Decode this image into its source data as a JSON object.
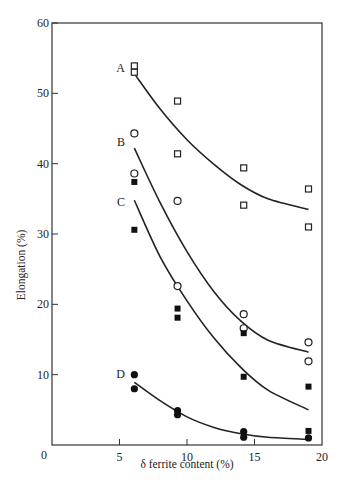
{
  "chart_data": {
    "type": "scatter",
    "title": "",
    "xlabel": "δ ferrite content (%)",
    "ylabel": "Elongation (%)",
    "xlim": [
      0,
      20
    ],
    "ylim": [
      0,
      60
    ],
    "xticks": [
      0,
      5,
      10,
      15,
      20
    ],
    "yticks": [
      0,
      10,
      20,
      30,
      40,
      50,
      60
    ],
    "grid": false,
    "legend": "none (curves labelled A, B, C, D inline)",
    "series": [
      {
        "name": "A",
        "marker": "open-square",
        "points": [
          [
            6.1,
            53.9
          ],
          [
            6.1,
            53.0
          ],
          [
            9.3,
            48.9
          ],
          [
            9.3,
            41.4
          ],
          [
            14.2,
            39.4
          ],
          [
            14.2,
            34.1
          ],
          [
            19.0,
            36.4
          ],
          [
            19.0,
            31.0
          ]
        ],
        "fit_curve": [
          [
            6.1,
            52.8
          ],
          [
            8,
            47.8
          ],
          [
            10,
            43.4
          ],
          [
            12,
            39.9
          ],
          [
            14,
            37.0
          ],
          [
            16,
            35.0
          ],
          [
            19,
            33.5
          ]
        ]
      },
      {
        "name": "B",
        "marker": "open-circle",
        "points": [
          [
            6.1,
            44.3
          ],
          [
            6.1,
            38.6
          ],
          [
            9.3,
            34.7
          ],
          [
            9.3,
            22.6
          ],
          [
            14.2,
            18.6
          ],
          [
            14.2,
            16.6
          ],
          [
            19.0,
            14.6
          ],
          [
            19.0,
            11.9
          ]
        ],
        "fit_curve": [
          [
            6.1,
            42.2
          ],
          [
            8,
            34.5
          ],
          [
            10,
            27.5
          ],
          [
            12,
            21.8
          ],
          [
            14,
            17.6
          ],
          [
            16,
            14.9
          ],
          [
            19,
            13.2
          ]
        ]
      },
      {
        "name": "C",
        "marker": "filled-square",
        "points": [
          [
            6.1,
            37.4
          ],
          [
            6.1,
            30.6
          ],
          [
            9.3,
            19.4
          ],
          [
            9.3,
            18.1
          ],
          [
            14.2,
            15.9
          ],
          [
            14.2,
            9.7
          ],
          [
            19.0,
            8.3
          ],
          [
            19.0,
            2.0
          ]
        ],
        "fit_curve": [
          [
            6.1,
            34.8
          ],
          [
            8,
            26.8
          ],
          [
            10,
            20.5
          ],
          [
            12,
            15.2
          ],
          [
            14,
            11.0
          ],
          [
            16,
            7.8
          ],
          [
            19,
            5.0
          ]
        ]
      },
      {
        "name": "D",
        "marker": "filled-circle",
        "points": [
          [
            6.1,
            10.0
          ],
          [
            6.1,
            8.0
          ],
          [
            9.3,
            4.9
          ],
          [
            9.3,
            4.3
          ],
          [
            14.2,
            1.9
          ],
          [
            14.2,
            1.1
          ],
          [
            19.0,
            1.0
          ]
        ],
        "fit_curve": [
          [
            6.1,
            8.9
          ],
          [
            8,
            6.3
          ],
          [
            10,
            4.0
          ],
          [
            12,
            2.5
          ],
          [
            14,
            1.6
          ],
          [
            16,
            1.1
          ],
          [
            19,
            0.8
          ]
        ]
      }
    ]
  },
  "axes": {
    "x_label": "δ ferrite content (%)",
    "y_label": "Elongation (%)",
    "x_tick_labels": [
      "0",
      "5",
      "10",
      "15",
      "20"
    ],
    "y_tick_labels": [
      "0",
      "10",
      "20",
      "30",
      "40",
      "50",
      "60"
    ]
  },
  "curve_labels": [
    "A",
    "B",
    "C",
    "D"
  ]
}
